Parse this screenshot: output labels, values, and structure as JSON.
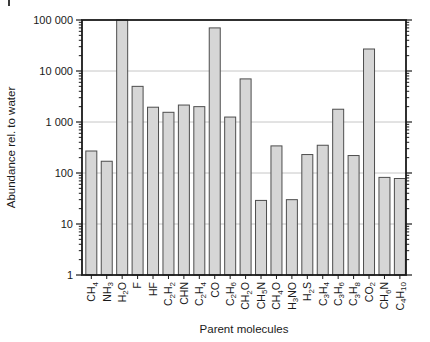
{
  "chart_data": {
    "type": "bar",
    "title": "",
    "xlabel": "Parent molecules",
    "ylabel": "Abundance rel. to water",
    "yscale": "log",
    "ylim": [
      1,
      100000
    ],
    "grid": true,
    "legend": false,
    "yticks": [
      {
        "value": 1,
        "label": "1"
      },
      {
        "value": 10,
        "label": "10"
      },
      {
        "value": 100,
        "label": "100"
      },
      {
        "value": 1000,
        "label": "1 000"
      },
      {
        "value": 10000,
        "label": "10 000"
      },
      {
        "value": 100000,
        "label": "100 000"
      }
    ],
    "categories": [
      "CH4",
      "NH3",
      "H2O",
      "F",
      "HF",
      "C2H2",
      "CHN",
      "C2H4",
      "CO",
      "C2H6",
      "CH2O",
      "CH5N",
      "CH4O",
      "H3NO",
      "H2S",
      "C3H4",
      "C3H6",
      "C3H8",
      "CO2",
      "CH6N",
      "C4H10"
    ],
    "values": [
      270,
      170,
      100000,
      5000,
      1950,
      1550,
      2150,
      2000,
      70000,
      1250,
      7000,
      29,
      340,
      30,
      230,
      350,
      1780,
      220,
      27000,
      82,
      78
    ],
    "colors": {
      "bar_fill": "#d6d6d6",
      "bar_stroke": "#4d4d4d",
      "grid": "#c6c6c6",
      "axis": "#1a1a1a",
      "text": "#1a1a1a"
    }
  }
}
